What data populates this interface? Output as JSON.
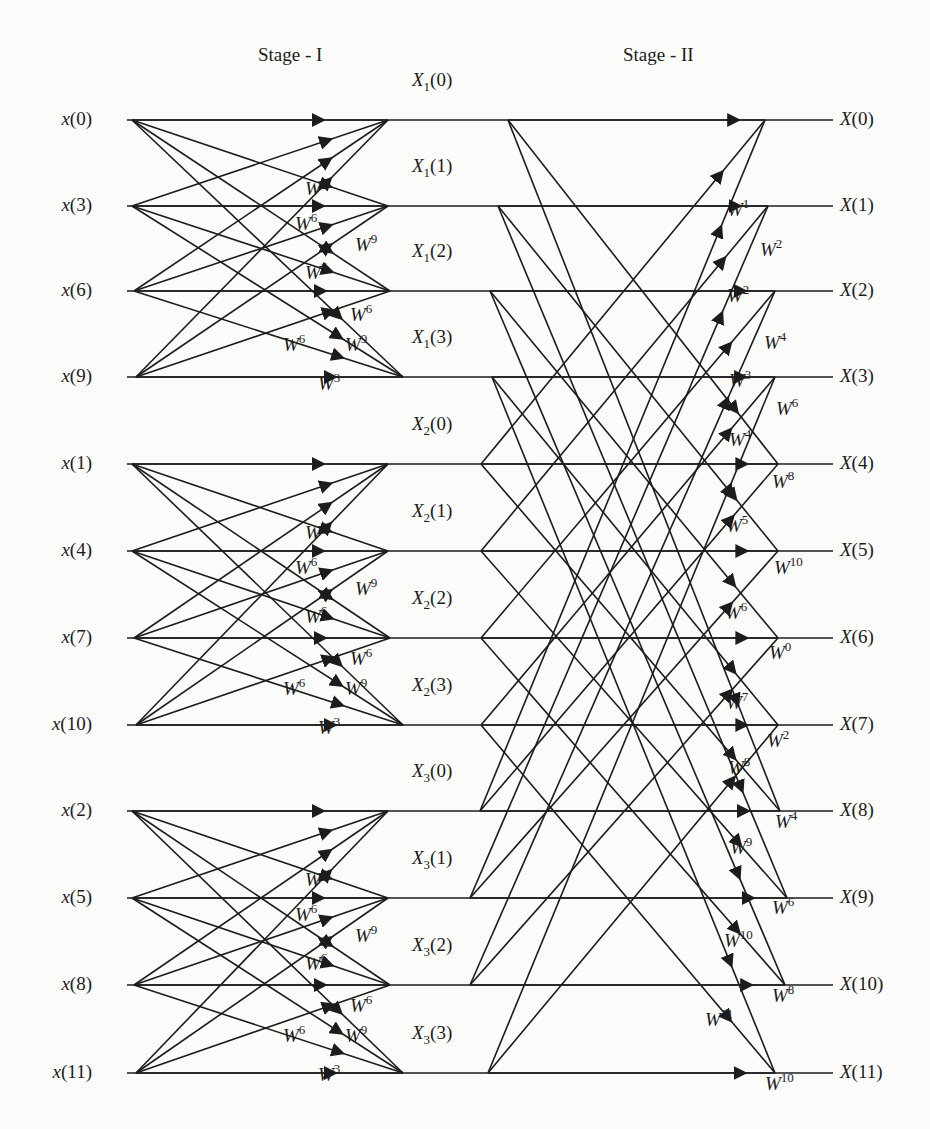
{
  "titles": {
    "stage1": "Stage - I",
    "stage2": "Stage - II"
  },
  "geometry": {
    "rows_y": [
      120,
      206,
      291,
      377,
      464,
      551,
      638,
      725,
      811,
      898,
      985,
      1073
    ],
    "line_start_x": 127,
    "line_end_x": 833,
    "stage1_fan_x": [
      [
        132,
        132,
        134,
        136
      ],
      [
        132,
        132,
        134,
        136
      ],
      [
        132,
        132,
        134,
        136
      ]
    ],
    "stage1_join_x": [
      [
        388,
        388,
        390,
        403
      ],
      [
        388,
        388,
        390,
        403
      ],
      [
        388,
        388,
        390,
        403
      ]
    ],
    "stage2_fan_x": [
      [
        508,
        498,
        490,
        492
      ],
      [
        481,
        481,
        481,
        481
      ],
      [
        480,
        470,
        470,
        488
      ]
    ],
    "stage2_join_x": [
      765,
      768,
      775,
      775,
      778,
      778,
      778,
      778,
      780,
      787,
      785,
      775
    ],
    "stroke": "#1c1c1c",
    "background": "#fbfbf9"
  },
  "inputs": [
    {
      "label": "x",
      "index": "0"
    },
    {
      "label": "x",
      "index": "3"
    },
    {
      "label": "x",
      "index": "6"
    },
    {
      "label": "x",
      "index": "9"
    },
    {
      "label": "x",
      "index": "1"
    },
    {
      "label": "x",
      "index": "4"
    },
    {
      "label": "x",
      "index": "7"
    },
    {
      "label": "x",
      "index": "10"
    },
    {
      "label": "x",
      "index": "2"
    },
    {
      "label": "x",
      "index": "5"
    },
    {
      "label": "x",
      "index": "8"
    },
    {
      "label": "x",
      "index": "11"
    }
  ],
  "intermediate": [
    {
      "sym": "X",
      "sub": "1",
      "index": "0"
    },
    {
      "sym": "X",
      "sub": "1",
      "index": "1"
    },
    {
      "sym": "X",
      "sub": "1",
      "index": "2"
    },
    {
      "sym": "X",
      "sub": "1",
      "index": "3"
    },
    {
      "sym": "X",
      "sub": "2",
      "index": "0"
    },
    {
      "sym": "X",
      "sub": "2",
      "index": "1"
    },
    {
      "sym": "X",
      "sub": "2",
      "index": "2"
    },
    {
      "sym": "X",
      "sub": "2",
      "index": "3"
    },
    {
      "sym": "X",
      "sub": "3",
      "index": "0"
    },
    {
      "sym": "X",
      "sub": "3",
      "index": "1"
    },
    {
      "sym": "X",
      "sub": "3",
      "index": "2"
    },
    {
      "sym": "X",
      "sub": "3",
      "index": "3"
    }
  ],
  "outputs": [
    {
      "label": "X",
      "index": "0"
    },
    {
      "label": "X",
      "index": "1"
    },
    {
      "label": "X",
      "index": "2"
    },
    {
      "label": "X",
      "index": "3"
    },
    {
      "label": "X",
      "index": "4"
    },
    {
      "label": "X",
      "index": "5"
    },
    {
      "label": "X",
      "index": "6"
    },
    {
      "label": "X",
      "index": "7"
    },
    {
      "label": "X",
      "index": "8"
    },
    {
      "label": "X",
      "index": "9"
    },
    {
      "label": "X",
      "index": "10"
    },
    {
      "label": "X",
      "index": "11"
    }
  ],
  "stage1_twiddles": [
    {
      "exp": "3",
      "dx": 305,
      "dy": 69
    },
    {
      "exp": "6",
      "dx": 295,
      "dy": 104
    },
    {
      "exp": "9",
      "dx": 355,
      "dy": 125
    },
    {
      "exp": "6",
      "dx": 305,
      "dy": 153
    },
    {
      "exp": "6",
      "dx": 350,
      "dy": 195
    },
    {
      "exp": "6",
      "dx": 283,
      "dy": 225
    },
    {
      "exp": "9",
      "dx": 345,
      "dy": 225
    },
    {
      "exp": "3",
      "dx": 318,
      "dy": 264
    }
  ],
  "stage2_twiddles": [
    {
      "exp": "1",
      "x": 727,
      "y": 210
    },
    {
      "exp": "2",
      "x": 760,
      "y": 250
    },
    {
      "exp": "2",
      "x": 727,
      "y": 296
    },
    {
      "exp": "4",
      "x": 764,
      "y": 343
    },
    {
      "exp": "3",
      "x": 729,
      "y": 381
    },
    {
      "exp": "6",
      "x": 776,
      "y": 409
    },
    {
      "exp": "4",
      "x": 729,
      "y": 440
    },
    {
      "exp": "8",
      "x": 772,
      "y": 482
    },
    {
      "exp": "5",
      "x": 726,
      "y": 526
    },
    {
      "exp": "10",
      "x": 774,
      "y": 568
    },
    {
      "exp": "6",
      "x": 725,
      "y": 613
    },
    {
      "exp": "0",
      "x": 769,
      "y": 653
    },
    {
      "exp": "7",
      "x": 726,
      "y": 703
    },
    {
      "exp": "2",
      "x": 767,
      "y": 741
    },
    {
      "exp": "8",
      "x": 728,
      "y": 768
    },
    {
      "exp": "4",
      "x": 775,
      "y": 822
    },
    {
      "exp": "9",
      "x": 730,
      "y": 848
    },
    {
      "exp": "6",
      "x": 772,
      "y": 908
    },
    {
      "exp": "10",
      "x": 724,
      "y": 941
    },
    {
      "exp": "8",
      "x": 772,
      "y": 996
    },
    {
      "exp": "11",
      "x": 705,
      "y": 1020
    },
    {
      "exp": "10",
      "x": 765,
      "y": 1084
    }
  ],
  "twiddle_symbol": "W"
}
